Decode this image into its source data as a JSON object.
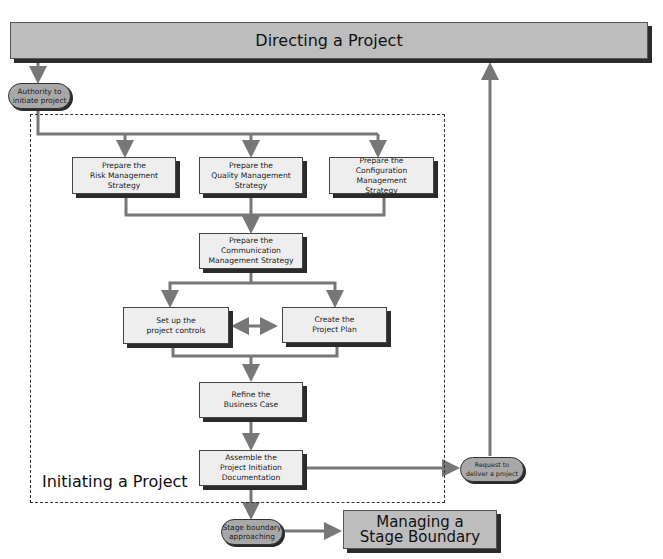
{
  "diagram": {
    "top_process": {
      "label": "Directing a Project"
    },
    "frame": {
      "label": "Initiating a Project"
    },
    "triggers": {
      "authority": {
        "label": "Authority to\ninitiate project"
      },
      "request": {
        "label": "Request to\ndeliver a project"
      },
      "stage_boundary": {
        "label": "Stage boundary\napproaching"
      }
    },
    "activities": {
      "risk": {
        "label": "Prepare the\nRisk Management\nStrategy"
      },
      "quality": {
        "label": "Prepare the\nQuality Management\nStrategy"
      },
      "configuration": {
        "label": "Prepare the\nConfiguration Management\nStrategy"
      },
      "communication": {
        "label": "Prepare the\nCommunication\nManagement Strategy"
      },
      "controls": {
        "label": "Set up the\nproject controls"
      },
      "plan": {
        "label": "Create the\nProject Plan"
      },
      "business_case": {
        "label": "Refine the\nBusiness Case"
      },
      "pid": {
        "label": "Assemble the\nProject Initiation\nDocumentation"
      }
    },
    "bottom_process": {
      "label": "Managing a\nStage Boundary"
    },
    "colors": {
      "process_fill": "#bdbdbd",
      "activity_fill": "#eeeeee",
      "trigger_fill": "#a8a8a8",
      "connector": "#777777",
      "shadow": "#2b2b2b"
    }
  }
}
